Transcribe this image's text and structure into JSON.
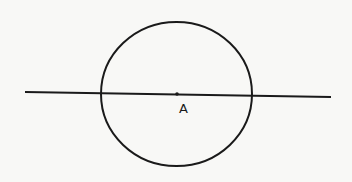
{
  "diagram": {
    "type": "geometry",
    "colors": {
      "background": "#f8f8f6",
      "stroke": "#1a1a1a"
    },
    "circle": {
      "center_label": "A",
      "cx": 176.5,
      "cy": 94,
      "rx": 75.5,
      "ry": 72
    },
    "line": {
      "x1": 25,
      "y1": 92,
      "x2": 331,
      "y2": 97
    },
    "point": {
      "label": "A",
      "x": 177,
      "y": 94
    }
  }
}
